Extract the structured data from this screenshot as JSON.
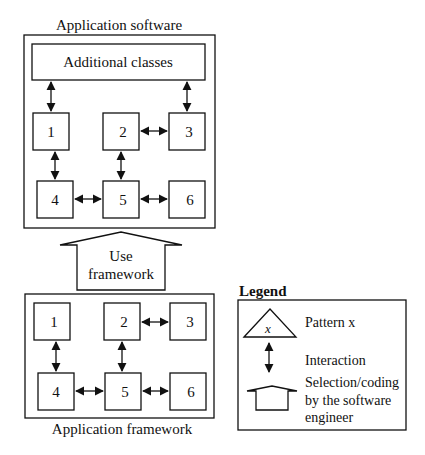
{
  "top_panel": {
    "title": "Application software",
    "additional_classes": "Additional classes",
    "boxes": [
      "1",
      "2",
      "3",
      "4",
      "5",
      "6"
    ]
  },
  "use_arrow": {
    "line1": "Use",
    "line2": "framework"
  },
  "bottom_panel": {
    "title": "Application framework",
    "boxes": [
      "1",
      "2",
      "3",
      "4",
      "5",
      "6"
    ]
  },
  "legend": {
    "title": "Legend",
    "pattern_symbol": "x",
    "pattern_label": "Pattern x",
    "interaction_label": "Interaction",
    "selection_line1": "Selection/coding",
    "selection_line2": "by the software",
    "selection_line3": "engineer"
  }
}
